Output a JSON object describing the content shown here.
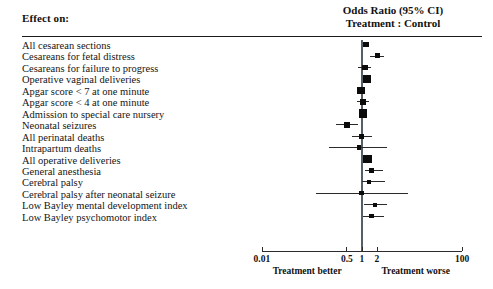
{
  "header": {
    "effect_label": "Effect on:",
    "or_line1": "Odds Ratio (95% CI)",
    "or_line2": "Treatment : Control"
  },
  "axis": {
    "ticks": [
      {
        "label": "0.01",
        "value": 0.01
      },
      {
        "label": "0.5",
        "value": 0.5
      },
      {
        "label": "1",
        "value": 1
      },
      {
        "label": "2",
        "value": 2
      },
      {
        "label": "100",
        "value": 100
      }
    ],
    "note_left": "Treatment better",
    "note_right": "Treatment worse"
  },
  "chart_data": {
    "type": "forest",
    "title": "Odds Ratio (95% CI) Treatment : Control",
    "xlabel": "Odds Ratio (95% CI)",
    "ylabel": "Effect on:",
    "scale": "log",
    "xlim": [
      0.01,
      100
    ],
    "xticks": [
      0.01,
      0.5,
      1,
      2,
      100
    ],
    "xticklabels": [
      "0.01",
      "0.5",
      "1",
      "2",
      "100"
    ],
    "reference_line": 1,
    "grid": false,
    "legend": null,
    "annotations": [
      "Treatment better",
      "Treatment worse"
    ],
    "categories": [
      "All cesarean sections",
      "Cesareans for fetal distress",
      "Cesareans for failure to progress",
      "Operative vaginal deliveries",
      "Apgar score < 7 at one minute",
      "Apgar score < 4 at one minute",
      "Admission to special care nursery",
      "Neonatal seizures",
      "All perinatal deaths",
      "Intrapartum deaths",
      "All operative deliveries",
      "General anesthesia",
      "Cerebral palsy",
      "Cerebral palsy after neonatal seizure",
      "Low Bayley mental development index",
      "Low Bayley psychomotor index"
    ],
    "points": [
      {
        "label": "All cesarean sections",
        "or": 1.2,
        "lo": 1.08,
        "hi": 1.4,
        "weight": 4
      },
      {
        "label": "Cesareans for fetal distress",
        "or": 2.0,
        "lo": 1.45,
        "hi": 2.8,
        "weight": 3
      },
      {
        "label": "Cesareans for failure to progress",
        "or": 1.15,
        "lo": 0.82,
        "hi": 1.5,
        "weight": 4
      },
      {
        "label": "Operative vaginal deliveries",
        "or": 1.25,
        "lo": 1.15,
        "hi": 1.35,
        "weight": 7
      },
      {
        "label": "Apgar score < 7 at one minute",
        "or": 0.95,
        "lo": 0.82,
        "hi": 1.1,
        "weight": 6
      },
      {
        "label": "Apgar score < 4 at one minute",
        "or": 1.05,
        "lo": 0.78,
        "hi": 1.4,
        "weight": 4
      },
      {
        "label": "Admission to special care nursery",
        "or": 1.05,
        "lo": 0.95,
        "hi": 1.15,
        "weight": 8
      },
      {
        "label": "Neonatal seizures",
        "or": 0.5,
        "lo": 0.3,
        "hi": 0.82,
        "weight": 4
      },
      {
        "label": "All perinatal deaths",
        "or": 0.98,
        "lo": 0.62,
        "hi": 1.6,
        "weight": 3
      },
      {
        "label": "Intrapartum deaths",
        "or": 0.88,
        "lo": 0.22,
        "hi": 3.2,
        "weight": 2
      },
      {
        "label": "All operative deliveries",
        "or": 1.3,
        "lo": 1.22,
        "hi": 1.42,
        "weight": 8
      },
      {
        "label": "General anesthesia",
        "or": 1.55,
        "lo": 1.15,
        "hi": 2.6,
        "weight": 3
      },
      {
        "label": "Cerebral palsy",
        "or": 1.4,
        "lo": 1.0,
        "hi": 2.9,
        "weight": 2
      },
      {
        "label": "Cerebral palsy after neonatal seizure",
        "or": 0.98,
        "lo": 0.12,
        "hi": 8.5,
        "weight": 2
      },
      {
        "label": "Low Bayley mental development index",
        "or": 1.85,
        "lo": 1.1,
        "hi": 3.1,
        "weight": 2
      },
      {
        "label": "Low Bayley psychomotor index",
        "or": 1.55,
        "lo": 1.05,
        "hi": 2.8,
        "weight": 2
      }
    ],
    "rows": [
      "All cesarean sections",
      "Cesareans for fetal distress",
      "Cesareans for failure to progress",
      "Operative vaginal deliveries",
      "Apgar score < 7 at one minute",
      "Apgar score < 4 at one minute",
      "Admission to special care nursery",
      "Neonatal seizures",
      "All perinatal deaths",
      "Intrapartum deaths",
      "All operative deliveries",
      "General anesthesia",
      "Cerebral palsy",
      "Cerebral palsy after neonatal seizure",
      "Low Bayley mental development index",
      "Low Bayley psychomotor index"
    ]
  },
  "colors": {
    "marker": "#0b0b0b",
    "ci": "#2a2a2a",
    "reference_line": "#555f66",
    "rule": "#1a1a1a",
    "text": "#111111",
    "background": "#ffffff"
  }
}
